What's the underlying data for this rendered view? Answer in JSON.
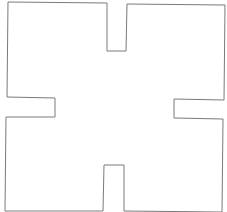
{
  "diagram": {
    "type": "floor-plan-outline",
    "stroke_color": "#7a7a7a",
    "background": "#ffffff",
    "outline_points": "8,2 107,3 107,51 126,51 127,4 225,5 224,100 174,99 174,118 223,119 222,212 124,211 124,165 104,165 103,211 5,211 6,117 55,117 55,98 7,97"
  }
}
